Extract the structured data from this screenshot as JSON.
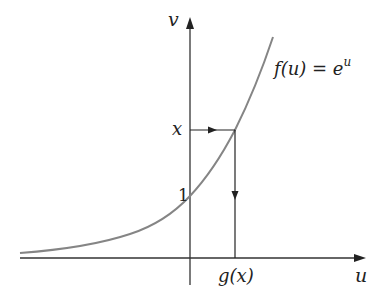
{
  "diagram": {
    "type": "function-inverse-illustration",
    "axes": {
      "x_label": "u",
      "y_label": "v"
    },
    "curve": {
      "label": "f(u) = e^u",
      "label_parts": {
        "base": "f(u) = e",
        "exponent": "u"
      },
      "color": "#858585"
    },
    "markers": {
      "y_tick_label": "1",
      "input_label": "x",
      "output_label": "g(x)"
    },
    "colors": {
      "axis": "#333333",
      "curve": "#858585",
      "arrow": "#222222"
    }
  }
}
